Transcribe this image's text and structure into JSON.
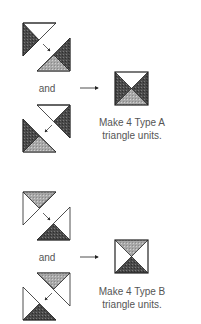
{
  "sections": [
    {
      "id": "type-a",
      "connector_label": "and",
      "caption_line1": "Make 4 Type A",
      "caption_line2": "triangle units.",
      "result_block": {
        "top": "white",
        "bottom": "light",
        "left": "dark",
        "right": "dark"
      }
    },
    {
      "id": "type-b",
      "connector_label": "and",
      "caption_line1": "Make 4 Type B",
      "caption_line2": "triangle units.",
      "result_block": {
        "top": "light",
        "bottom": "dark",
        "left": "white",
        "right": "white"
      }
    }
  ],
  "colors": {
    "dark": "#4a4a4a",
    "light": "#a8a8a8",
    "line": "#222222",
    "text": "#555555"
  }
}
